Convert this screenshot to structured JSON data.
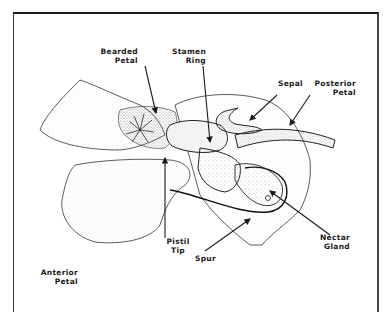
{
  "figure": {
    "labels": {
      "bearded_petal": "Bearded\nPetal",
      "stamen_ring": "Stamen\nRing",
      "sepal": "Sepal",
      "posterior_petal": "Posterior\nPetal",
      "pistil_tip": "Pistil\nTip",
      "spur": "Spur",
      "nectar_gland": "Nectar\nGland",
      "anterior_petal": "Anterior\nPetal"
    },
    "colors": {
      "ink": "#1a1a1a",
      "background": "#ffffff",
      "stipple": "#8a8a8a"
    }
  }
}
